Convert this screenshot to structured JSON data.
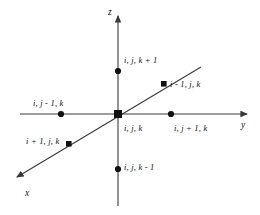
{
  "figure": {
    "background_color": "#ffffff",
    "line_color": "#3a3a3a",
    "text_color": "#111111",
    "width": 260,
    "height": 215
  },
  "axes": [
    {
      "name": "z",
      "label": "z",
      "orientation": "vertical-up",
      "label_x": 108,
      "label_y": 8
    },
    {
      "name": "y",
      "label": "y",
      "orientation": "horizontal-right",
      "label_x": 241,
      "label_y": 121
    },
    {
      "name": "x",
      "label": "x",
      "orientation": "diagonal-down-left",
      "label_x": 25,
      "label_y": 189
    }
  ],
  "nodes": [
    {
      "name": "node-up",
      "label": "i, j, k + 1",
      "dot_x": 118,
      "dot_y": 71,
      "label_x": 124,
      "label_y": 56,
      "axis": "z",
      "offset": "+1"
    },
    {
      "name": "node-center",
      "label": "i, j, k",
      "dot_x": 118,
      "dot_y": 114,
      "label_x": 124,
      "label_y": 124,
      "axis": "origin",
      "offset": "0"
    },
    {
      "name": "node-down",
      "label": "i, j, k - 1",
      "dot_x": 118,
      "dot_y": 169,
      "label_x": 124,
      "label_y": 163,
      "axis": "z",
      "offset": "-1"
    },
    {
      "name": "node-left",
      "label": "i, j - 1, k",
      "dot_x": 61,
      "dot_y": 114,
      "label_x": 33,
      "label_y": 99,
      "axis": "y",
      "offset": "-1"
    },
    {
      "name": "node-right",
      "label": "i, j + 1, k",
      "dot_x": 171,
      "dot_y": 114,
      "label_x": 174,
      "label_y": 124,
      "axis": "y",
      "offset": "+1"
    },
    {
      "name": "node-back",
      "label": "i - 1, j, k",
      "dot_x": 164,
      "dot_y": 84,
      "label_x": 170,
      "label_y": 84,
      "axis": "x",
      "offset": "-1"
    },
    {
      "name": "node-front",
      "label": "i + 1, j, k",
      "dot_x": 69,
      "dot_y": 144,
      "label_x": 26,
      "label_y": 137,
      "axis": "x",
      "offset": "+1"
    }
  ]
}
